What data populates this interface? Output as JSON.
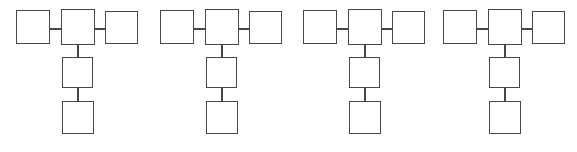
{
  "canvas": {
    "width": 577,
    "height": 152,
    "background_color": "#ffffff",
    "stroke_color": "#474747",
    "stroke_width": 1.6
  },
  "diagram": {
    "type": "node-link-diagram",
    "group_count": 4,
    "nodes_per_group": 5,
    "edges_per_group": 4,
    "node_shape": "rectangle",
    "node_fill": "#ffffff",
    "node_labels_present": false
  },
  "groups": [
    {
      "index": 1,
      "x": 16,
      "nodes": [
        "left",
        "center",
        "right",
        "middle",
        "bottom"
      ]
    },
    {
      "index": 2,
      "x": 160,
      "nodes": [
        "left",
        "center",
        "right",
        "middle",
        "bottom"
      ]
    },
    {
      "index": 3,
      "x": 303,
      "nodes": [
        "left",
        "center",
        "right",
        "middle",
        "bottom"
      ]
    },
    {
      "index": 4,
      "x": 443,
      "nodes": [
        "left",
        "center",
        "right",
        "middle",
        "bottom"
      ]
    }
  ],
  "edges": [
    {
      "from": "left",
      "to": "center",
      "orientation": "horizontal"
    },
    {
      "from": "center",
      "to": "right",
      "orientation": "horizontal"
    },
    {
      "from": "center",
      "to": "middle",
      "orientation": "vertical"
    },
    {
      "from": "middle",
      "to": "bottom",
      "orientation": "vertical"
    }
  ]
}
